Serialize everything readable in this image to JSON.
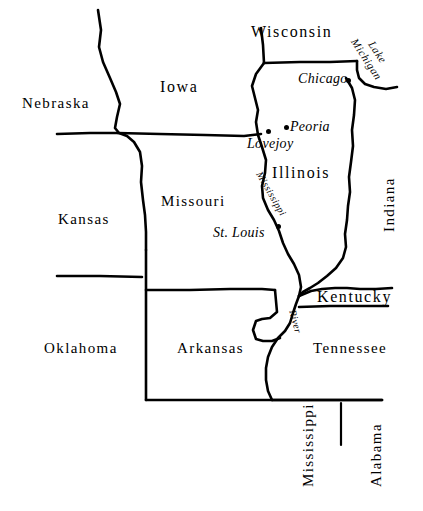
{
  "map": {
    "title": "Illinois and surrounding states outline map",
    "background_color": "#ffffff",
    "line_color": "#000000",
    "states": [
      {
        "name": "Wisconsin",
        "x": 251,
        "y": 24,
        "size": "big",
        "rotation": 0
      },
      {
        "name": "Iowa",
        "x": 160,
        "y": 79,
        "size": "big",
        "rotation": 0
      },
      {
        "name": "Nebraska",
        "x": 22,
        "y": 96,
        "size": "normal",
        "rotation": 0
      },
      {
        "name": "Illinois",
        "x": 272,
        "y": 165,
        "size": "big",
        "rotation": 0
      },
      {
        "name": "Missouri",
        "x": 161,
        "y": 194,
        "size": "normal",
        "rotation": 0
      },
      {
        "name": "Kansas",
        "x": 58,
        "y": 212,
        "size": "normal",
        "rotation": 0
      },
      {
        "name": "Indiana",
        "x": 382,
        "y": 232,
        "size": "normal",
        "rotation": -90
      },
      {
        "name": "Kentucky",
        "x": 317,
        "y": 289,
        "size": "big",
        "rotation": 0
      },
      {
        "name": "Oklahoma",
        "x": 44,
        "y": 341,
        "size": "normal",
        "rotation": 0
      },
      {
        "name": "Arkansas",
        "x": 177,
        "y": 341,
        "size": "normal",
        "rotation": 0
      },
      {
        "name": "Tennessee",
        "x": 313,
        "y": 341,
        "size": "normal",
        "rotation": 0
      },
      {
        "name": "Mississippi",
        "x": 301,
        "y": 487,
        "size": "normal",
        "rotation": -90
      },
      {
        "name": "Alabama",
        "x": 369,
        "y": 487,
        "size": "normal",
        "rotation": -90
      }
    ],
    "cities": [
      {
        "name": "Chicago",
        "label_x": 298,
        "label_y": 72,
        "dot_x": 346,
        "dot_y": 78
      },
      {
        "name": "Peoria",
        "label_x": 290,
        "label_y": 120,
        "dot_x": 284,
        "dot_y": 125
      },
      {
        "name": "Lovejoy",
        "label_x": 247,
        "label_y": 137,
        "dot_x": 266,
        "dot_y": 129
      },
      {
        "name": "St. Louis",
        "label_x": 213,
        "label_y": 226,
        "dot_x": 276,
        "dot_y": 224
      }
    ],
    "waters": [
      {
        "name": "Lake Michigan",
        "line1": "Lake",
        "line2": "Michigan",
        "x": 370,
        "y": 29,
        "rotation": 57
      },
      {
        "name": "Mississippi",
        "x": 263,
        "y": 170,
        "rotation": 60
      },
      {
        "name": "River",
        "x": 297,
        "y": 309,
        "rotation": 75
      }
    ]
  }
}
